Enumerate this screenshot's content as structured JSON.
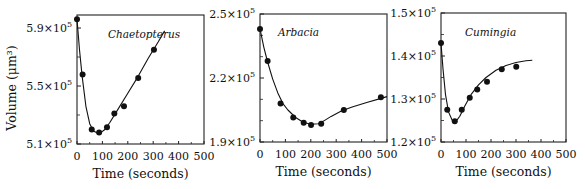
{
  "figure": {
    "ylabel": "Volume (μm³)",
    "xlabel": "Time (seconds)"
  },
  "chart_data": [
    {
      "type": "scatter",
      "title": "Chaetopterus",
      "xlabel": "Time (seconds)",
      "ylabel": "Volume (μm³)",
      "xlim": [
        0,
        500
      ],
      "ylim": [
        510000,
        599000
      ],
      "xticks": [
        0,
        100,
        200,
        300,
        400,
        500
      ],
      "yticks": [
        510000,
        550000,
        590000
      ],
      "ytick_labels": [
        "5.1×10⁵",
        "5.5×10⁵",
        "5.9×10⁵"
      ],
      "grid": false,
      "series": [
        {
          "name": "measured",
          "kind": "points",
          "x": [
            0,
            22,
            58,
            87,
            118,
            147,
            185,
            241,
            303
          ],
          "y": [
            596000,
            558000,
            520000,
            518000,
            521500,
            531000,
            536000,
            555500,
            575000
          ]
        },
        {
          "name": "model fit",
          "kind": "curve",
          "x": [
            0,
            10,
            20,
            35,
            50,
            65,
            80,
            95,
            110,
            130,
            160,
            200,
            240,
            280,
            320,
            345
          ],
          "y": [
            596000,
            575000,
            557000,
            536000,
            524000,
            519000,
            517500,
            518000,
            520000,
            525000,
            533500,
            545000,
            556500,
            569000,
            580500,
            588000
          ]
        }
      ]
    },
    {
      "type": "scatter",
      "title": "Arbacia",
      "xlabel": "Time (seconds)",
      "ylabel": "",
      "xlim": [
        0,
        500
      ],
      "ylim": [
        190000,
        250000
      ],
      "xticks": [
        0,
        100,
        200,
        300,
        400,
        500
      ],
      "yticks": [
        190000,
        220000,
        250000
      ],
      "ytick_labels": [
        "1.9×10⁵",
        "2.2×10⁵",
        "2.5×10⁵"
      ],
      "grid": false,
      "series": [
        {
          "name": "measured",
          "kind": "points",
          "x": [
            0,
            30,
            81,
            131,
            172,
            201,
            241,
            330,
            476
          ],
          "y": [
            243000,
            228000,
            208000,
            201500,
            199000,
            198000,
            198500,
            205000,
            211000
          ]
        },
        {
          "name": "model fit",
          "kind": "curve",
          "x": [
            0,
            15,
            30,
            50,
            70,
            90,
            110,
            140,
            170,
            200,
            230,
            250,
            280,
            320,
            360,
            420,
            480,
            500
          ],
          "y": [
            243000,
            234500,
            227500,
            219500,
            213000,
            208000,
            205000,
            201500,
            199300,
            198300,
            198600,
            199800,
            202000,
            204600,
            206300,
            208500,
            210600,
            211300
          ]
        }
      ]
    },
    {
      "type": "scatter",
      "title": "Cumingia",
      "xlabel": "Time (seconds)",
      "ylabel": "",
      "xlim": [
        0,
        500
      ],
      "ylim": [
        120000,
        150000
      ],
      "xticks": [
        0,
        100,
        200,
        300,
        400,
        500
      ],
      "yticks": [
        120000,
        130000,
        140000,
        150000
      ],
      "ytick_labels": [
        "1.2×10⁵",
        "1.3×10⁵",
        "1.4×10⁵",
        "1.5×10⁵"
      ],
      "grid": false,
      "series": [
        {
          "name": "measured",
          "kind": "points",
          "x": [
            0,
            25,
            55,
            83,
            115,
            145,
            184,
            243,
            301
          ],
          "y": [
            143000,
            127500,
            124800,
            127500,
            130300,
            132200,
            134000,
            136900,
            137500
          ]
        },
        {
          "name": "model fit",
          "kind": "curve",
          "x": [
            0,
            8,
            18,
            30,
            45,
            60,
            75,
            95,
            120,
            150,
            180,
            220,
            260,
            300,
            340,
            365
          ],
          "y": [
            143000,
            137000,
            131000,
            127000,
            125000,
            124800,
            126000,
            128400,
            131000,
            133300,
            135000,
            136700,
            137800,
            138500,
            138900,
            139000
          ]
        }
      ]
    }
  ]
}
